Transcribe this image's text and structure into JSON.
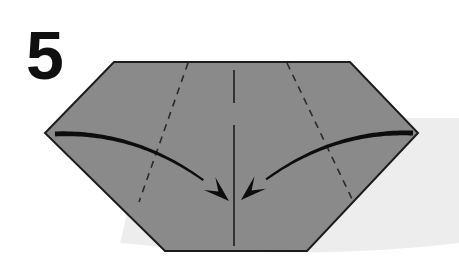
{
  "diagram": {
    "kind": "origami-fold-step",
    "step_number": "5",
    "canvas": {
      "width": 459,
      "height": 257
    },
    "background_color": "#ffffff",
    "paper": {
      "name": "folded-paper-hexagon",
      "fill_color": "#8a8a8a",
      "edge_color": "#1c1c1c",
      "edge_width": 2,
      "vertices": [
        {
          "x": 114,
          "y": 62
        },
        {
          "x": 350,
          "y": 62
        },
        {
          "x": 418,
          "y": 133
        },
        {
          "x": 307,
          "y": 251
        },
        {
          "x": 165,
          "y": 251
        },
        {
          "x": 45,
          "y": 133
        }
      ]
    },
    "shadow": {
      "name": "paper-drop-shadow",
      "fill_color": "#ededed",
      "description": "soft light gray cast shadow lower-right of the paper"
    },
    "crease_lines": [
      {
        "name": "left-valley-crease",
        "style": "dashed",
        "color": "#2a2a2a",
        "width": 1.6,
        "dash": "7 6",
        "from": {
          "x": 188,
          "y": 63
        },
        "to": {
          "x": 139,
          "y": 202
        }
      },
      {
        "name": "right-valley-crease",
        "style": "dashed",
        "color": "#2a2a2a",
        "width": 1.6,
        "dash": "7 6",
        "from": {
          "x": 287,
          "y": 63
        },
        "to": {
          "x": 353,
          "y": 201
        }
      }
    ],
    "center_line": {
      "name": "center-vertical-reference-line",
      "style": "solid",
      "color": "#2a2a2a",
      "width": 1.8,
      "x": 234,
      "segments": [
        {
          "y_start": 70,
          "y_end": 103
        },
        {
          "y_start": 125,
          "y_end": 246
        }
      ]
    },
    "arrows": [
      {
        "name": "left-fold-arrow",
        "color": "#0d0d0d",
        "direction": "inward-right-down",
        "start": {
          "x": 55,
          "y": 134
        },
        "end": {
          "x": 229,
          "y": 201
        },
        "control": {
          "x": 150,
          "y": 130
        },
        "head_length": 26,
        "head_width": 17
      },
      {
        "name": "right-fold-arrow",
        "color": "#0d0d0d",
        "direction": "inward-left-down",
        "start": {
          "x": 413,
          "y": 133
        },
        "end": {
          "x": 241,
          "y": 200
        },
        "control": {
          "x": 318,
          "y": 130
        },
        "head_length": 26,
        "head_width": 17
      }
    ]
  }
}
